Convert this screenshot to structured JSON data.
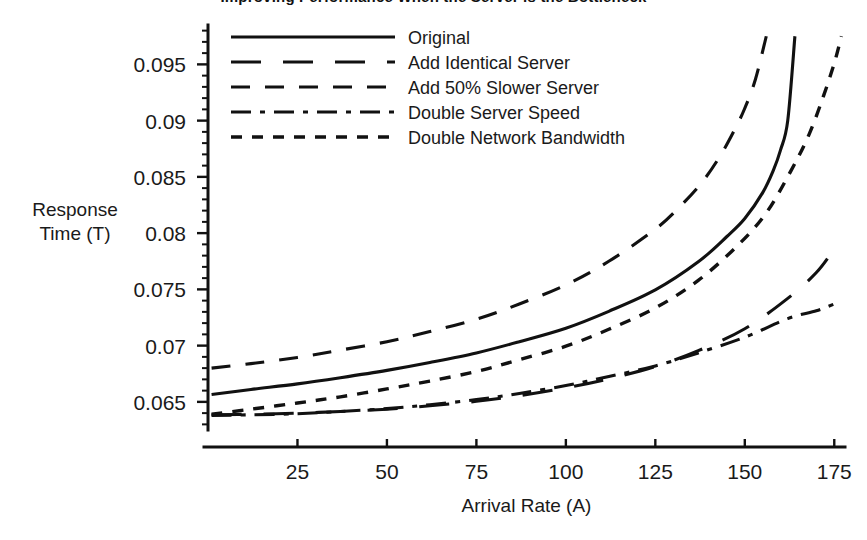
{
  "chart_data": {
    "type": "line",
    "title": "Improving Performance When the Server is the Bottleneck",
    "xlabel": "Arrival Rate (A)",
    "ylabel": "Response Time (T)",
    "xlim": [
      0,
      178
    ],
    "ylim": [
      0.0625,
      0.0985
    ],
    "xticks": [
      25,
      50,
      75,
      100,
      125,
      150,
      175
    ],
    "yticks": [
      0.065,
      0.07,
      0.075,
      0.08,
      0.085,
      0.09,
      0.095
    ],
    "ytick_labels": [
      "0.065",
      "0.07",
      "0.075",
      "0.08",
      "0.085",
      "0.09",
      "0.095"
    ],
    "xtick_labels": [
      "25",
      "50",
      "75",
      "100",
      "125",
      "150",
      "175"
    ],
    "grid": false,
    "minor_ticks": true,
    "legend_position": "top-center",
    "series": [
      {
        "name": "Original",
        "dash": "solid",
        "x": [
          1,
          12,
          25,
          37,
          50,
          62,
          75,
          87,
          100,
          112,
          125,
          137,
          145,
          150,
          155,
          158,
          160,
          162,
          164
        ],
        "y": [
          0.06565,
          0.0661,
          0.0666,
          0.06715,
          0.0678,
          0.0685,
          0.06935,
          0.07035,
          0.07155,
          0.07305,
          0.07495,
          0.07745,
          0.0797,
          0.0813,
          0.0836,
          0.0856,
          0.0874,
          0.09,
          0.0975
        ]
      },
      {
        "name": "Add Identical Server",
        "dash": "long",
        "x": [
          1,
          12,
          25,
          37,
          50,
          62,
          75,
          87,
          100,
          112,
          125,
          137,
          150,
          162,
          170,
          175
        ],
        "y": [
          0.06385,
          0.0639,
          0.064,
          0.06415,
          0.06435,
          0.06465,
          0.06505,
          0.06555,
          0.06625,
          0.06705,
          0.06815,
          0.06955,
          0.0715,
          0.0742,
          0.0765,
          0.0786
        ]
      },
      {
        "name": "Add 50% Slower Server",
        "dash": "dash",
        "x": [
          1,
          12,
          25,
          37,
          50,
          62,
          75,
          87,
          100,
          112,
          125,
          132,
          138,
          143,
          147,
          150,
          153,
          156
        ],
        "y": [
          0.068,
          0.0684,
          0.06895,
          0.0696,
          0.07035,
          0.07125,
          0.07235,
          0.0737,
          0.0754,
          0.0775,
          0.08035,
          0.0824,
          0.0845,
          0.0868,
          0.0891,
          0.0911,
          0.0937,
          0.0975
        ]
      },
      {
        "name": "Double Server Speed",
        "dash": "dashdot",
        "x": [
          1,
          12,
          25,
          37,
          50,
          62,
          75,
          87,
          100,
          112,
          125,
          137,
          150,
          162,
          170,
          175
        ],
        "y": [
          0.0638,
          0.06385,
          0.06395,
          0.06415,
          0.0644,
          0.06475,
          0.0652,
          0.06575,
          0.06645,
          0.06725,
          0.0682,
          0.06935,
          0.07075,
          0.0724,
          0.0731,
          0.0737
        ]
      },
      {
        "name": "Double Network Bandwidth",
        "dash": "short",
        "x": [
          1,
          12,
          25,
          37,
          50,
          62,
          75,
          87,
          100,
          112,
          125,
          137,
          148,
          156,
          163,
          168,
          172,
          175,
          177
        ],
        "y": [
          0.0639,
          0.06435,
          0.0649,
          0.06545,
          0.06615,
          0.06685,
          0.0677,
          0.06875,
          0.06995,
          0.07145,
          0.07335,
          0.0758,
          0.0789,
          0.0818,
          0.0856,
          0.0888,
          0.0922,
          0.0951,
          0.0975
        ]
      }
    ]
  },
  "legend": {
    "items": [
      {
        "label": "Original"
      },
      {
        "label": "Add Identical Server"
      },
      {
        "label": "Add 50% Slower Server"
      },
      {
        "label": "Double Server Speed"
      },
      {
        "label": "Double Network Bandwidth"
      }
    ]
  },
  "colors": {
    "ink": "#111111",
    "background": "#ffffff"
  }
}
